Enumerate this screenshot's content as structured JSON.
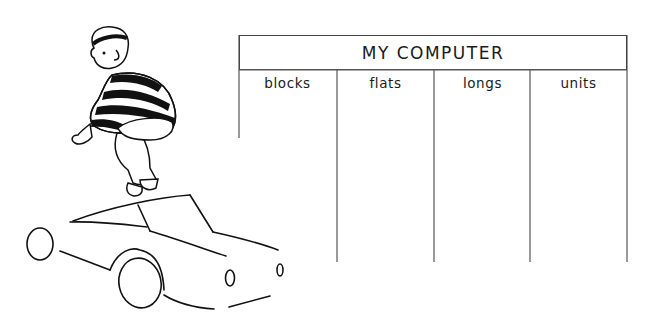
{
  "table": {
    "title": "MY COMPUTER",
    "columns": [
      {
        "label": "blocks"
      },
      {
        "label": "flats"
      },
      {
        "label": "longs"
      },
      {
        "label": "units"
      }
    ]
  },
  "illustration": {
    "figure": "child-jumping-striped-sweater",
    "vehicle": "car-outline"
  },
  "colors": {
    "ink": "#111111",
    "background": "#ffffff"
  }
}
